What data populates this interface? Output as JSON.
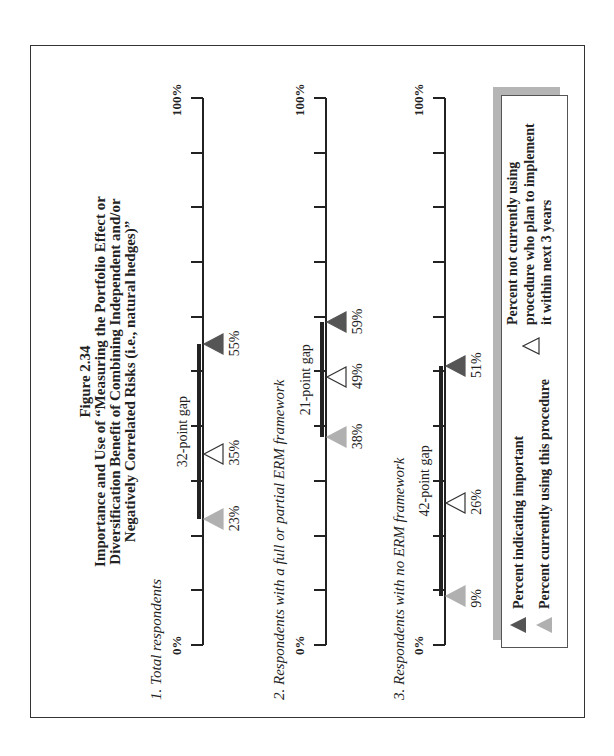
{
  "title": {
    "figure": "Figure 2.34",
    "lines": [
      "Importance and Use of “Measuring the Portfolio Effect or",
      "Diversification Benefit of Combining Independent and/or",
      "Negatively Correlated Risks (i.e., natural hedges)”"
    ]
  },
  "axis": {
    "min_label": "0%",
    "max_label": "100%"
  },
  "colors": {
    "important": "#555555",
    "using": "#b0b0b0",
    "plan": "#ffffff",
    "stroke": "#222222"
  },
  "legend": {
    "important": "Percent indicating important",
    "using": "Percent currently using this procedure",
    "plan_lines": [
      "Percent not currently using",
      "procedure who plan to implement",
      "it within next 3 years"
    ]
  },
  "chart_data": {
    "type": "dot-plot",
    "title": "Importance and Use of “Measuring the Portfolio Effect or Diversification Benefit of Combining Independent and/or Negatively Correlated Risks (i.e., natural hedges)”",
    "subtitle": "Figure 2.34",
    "xlim": [
      0,
      100
    ],
    "tick_interval": 10,
    "series_names": [
      "Percent indicating important",
      "Percent currently using this procedure",
      "Percent not currently using procedure who plan to implement it within next 3 years"
    ],
    "rows": [
      {
        "label": "1.  Total respondents",
        "important": 55,
        "using": 23,
        "plan": 35,
        "gap_label": "32-point gap",
        "labels": {
          "important": "55%",
          "using": "23%",
          "plan": "35%"
        }
      },
      {
        "label": "2.  Respondents with a full or partial ERM framework",
        "important": 59,
        "using": 38,
        "plan": 49,
        "gap_label": "21-point gap",
        "labels": {
          "important": "59%",
          "using": "38%",
          "plan": "49%"
        }
      },
      {
        "label": "3.  Respondents with no ERM framework",
        "important": 51,
        "using": 9,
        "plan": 26,
        "gap_label": "42-point gap",
        "labels": {
          "important": "51%",
          "using": "9%",
          "plan": "26%"
        }
      }
    ]
  }
}
